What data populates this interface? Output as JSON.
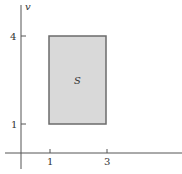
{
  "diagram": {
    "axes": {
      "y_label": "v",
      "x_ticks": [
        {
          "label": "1",
          "value": 1
        },
        {
          "label": "3",
          "value": 3
        }
      ],
      "y_ticks": [
        {
          "label": "4",
          "value": 4
        },
        {
          "label": "1",
          "value": 1
        }
      ]
    },
    "region": {
      "label": "S",
      "x_range": [
        1,
        3
      ],
      "y_range": [
        1,
        4
      ],
      "fill": "#d9d9d9",
      "stroke": "#6b6b6b"
    }
  }
}
